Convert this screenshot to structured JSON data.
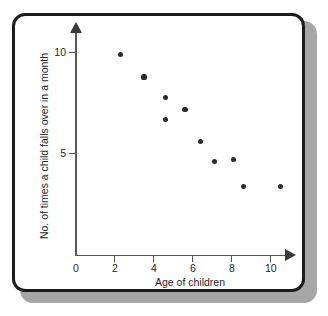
{
  "figure": {
    "background_color": "#ffffff",
    "frame_color": "#1c1c1c",
    "shadow_color": "#a6a6a6",
    "marker_color": "#2b2b2d",
    "axis_color": "#58585a"
  },
  "chart_data": {
    "type": "scatter",
    "title": "",
    "subtitle": "",
    "xlabel": "Age of children",
    "ylabel": "No. of times a child falls over in a month",
    "xlim": [
      0,
      11
    ],
    "ylim": [
      0,
      10.8
    ],
    "xticks": [
      0,
      2,
      4,
      6,
      8,
      10
    ],
    "xticklabels": [
      "0",
      "2",
      "4",
      "6",
      "8",
      "10"
    ],
    "yticks": [
      5,
      10
    ],
    "yticklabels": [
      "5",
      "10"
    ],
    "grid": false,
    "legend": null,
    "annotations": [],
    "series": [
      {
        "name": "children",
        "marker": "filled-circle",
        "color": "#2b2b2d",
        "points": [
          {
            "x": 2.3,
            "y": 9.9
          },
          {
            "x": 3.5,
            "y": 8.8
          },
          {
            "x": 4.6,
            "y": 7.8
          },
          {
            "x": 4.6,
            "y": 6.7
          },
          {
            "x": 5.6,
            "y": 7.2
          },
          {
            "x": 6.4,
            "y": 5.6
          },
          {
            "x": 7.1,
            "y": 4.6
          },
          {
            "x": 8.1,
            "y": 4.7
          },
          {
            "x": 8.6,
            "y": 3.4
          },
          {
            "x": 10.5,
            "y": 3.4
          }
        ]
      }
    ]
  }
}
